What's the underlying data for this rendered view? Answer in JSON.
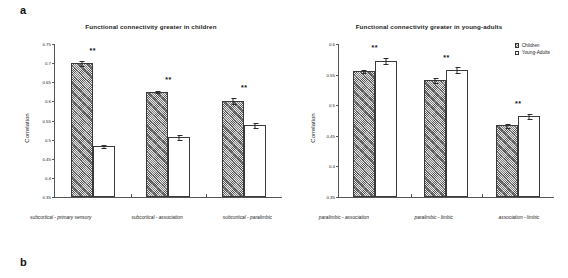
{
  "panels": {
    "a_label": "a",
    "b_label": "b"
  },
  "legend": {
    "items": [
      {
        "label": "Children",
        "swatch": "hatched-square-icon"
      },
      {
        "label": "Young-Adults",
        "swatch": "empty-square-icon"
      }
    ]
  },
  "colors": {
    "children_fill": "#7d7d7d",
    "adults_fill": "#ffffff",
    "axis": "#555555",
    "text": "#1a1a1a"
  },
  "chart_data": [
    {
      "id": "children-greater",
      "type": "bar",
      "title": "Functional connectivity greater in children",
      "xlabel": "",
      "ylabel": "Correlation",
      "ylim": [
        0.35,
        0.75
      ],
      "yticks": [
        0.75,
        0.7,
        0.65,
        0.6,
        0.55,
        0.5,
        0.45,
        0.4,
        0.35
      ],
      "ytick_labels": [
        "0.75",
        "0.7",
        "0.65",
        "0.6",
        "0.55",
        "0.5",
        "0.45",
        "0.4",
        "0.35"
      ],
      "grid": false,
      "legend_position": "none",
      "categories": [
        "subcortical - primary sensory",
        "subcortical - association",
        "subcortical - paralimbic"
      ],
      "series": [
        {
          "name": "Children",
          "values": [
            0.701,
            0.625,
            0.602
          ],
          "errors": [
            0.008,
            0.004,
            0.01
          ]
        },
        {
          "name": "Young-Adults",
          "values": [
            0.484,
            0.506,
            0.539
          ],
          "errors": [
            0.005,
            0.008,
            0.008
          ]
        }
      ],
      "annotations": [
        {
          "text": "**",
          "category": "subcortical - primary sensory"
        },
        {
          "text": "**",
          "category": "subcortical - association"
        },
        {
          "text": "**",
          "category": "subcortical - paralimbic"
        }
      ]
    },
    {
      "id": "young-adults-greater",
      "type": "bar",
      "title": "Functional connectivity greater in young-adults",
      "xlabel": "",
      "ylabel": "Correlation",
      "ylim": [
        0.35,
        0.6
      ],
      "yticks": [
        0.6,
        0.55,
        0.5,
        0.45,
        0.4,
        0.35
      ],
      "ytick_labels": [
        "0.6",
        "0.55",
        "0.5",
        "0.45",
        "0.4",
        "0.35"
      ],
      "grid": false,
      "legend_position": "top-right",
      "categories": [
        "paralimbic - association",
        "paralimbic - limbic",
        "association - limbic"
      ],
      "series": [
        {
          "name": "Children",
          "values": [
            0.556,
            0.542,
            0.467
          ],
          "errors": [
            0.004,
            0.005,
            0.004
          ]
        },
        {
          "name": "Young-Adults",
          "values": [
            0.573,
            0.558,
            0.482
          ],
          "errors": [
            0.006,
            0.006,
            0.005
          ]
        }
      ],
      "annotations": [
        {
          "text": "**",
          "category": "paralimbic - association"
        },
        {
          "text": "**",
          "category": "paralimbic - limbic"
        },
        {
          "text": "**",
          "category": "association - limbic"
        }
      ]
    }
  ]
}
